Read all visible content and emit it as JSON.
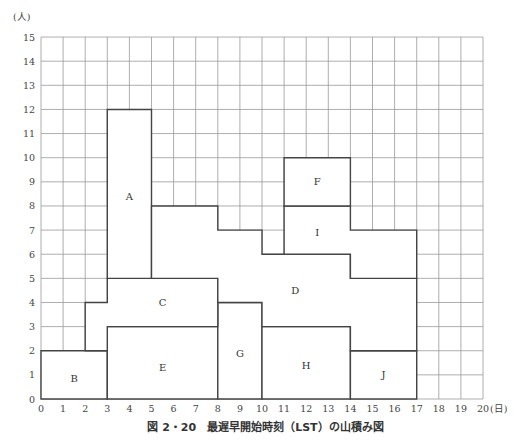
{
  "chart_data": {
    "type": "heatmap",
    "subtype": "resource-loading (yamazumi) block chart",
    "xlabel": "(日)",
    "ylabel": "(人)",
    "xlim": [
      0,
      20
    ],
    "ylim": [
      0,
      15
    ],
    "xticks": [
      0,
      1,
      2,
      3,
      4,
      5,
      6,
      7,
      8,
      9,
      10,
      11,
      12,
      13,
      14,
      15,
      16,
      17,
      18,
      19,
      20
    ],
    "yticks": [
      0,
      1,
      2,
      3,
      4,
      5,
      6,
      7,
      8,
      9,
      10,
      11,
      12,
      13,
      14,
      15
    ],
    "grid": true,
    "blocks": [
      {
        "label": "B",
        "x_start": 0,
        "x_end": 3,
        "y_bottom": 0,
        "y_top": 2
      },
      {
        "label": "E",
        "x_start": 3,
        "x_end": 8,
        "y_bottom": 0,
        "y_top": 3
      },
      {
        "label": "G",
        "x_start": 8,
        "x_end": 10,
        "y_bottom": 0,
        "y_top": 4
      },
      {
        "label": "H",
        "x_start": 10,
        "x_end": 14,
        "y_bottom": 0,
        "y_top": 3
      },
      {
        "label": "J",
        "x_start": 14,
        "x_end": 17,
        "y_bottom": 0,
        "y_top": 2
      },
      {
        "label": "C",
        "x_start": 2,
        "x_end": 8,
        "y_bottom": "2-3",
        "y_top": "4-5"
      },
      {
        "label": "A",
        "x_start": 3,
        "x_end": 5,
        "y_bottom": 5,
        "y_top": 12
      },
      {
        "label": "D",
        "x_start": 5,
        "x_end": 17,
        "y_bottom": "3-5",
        "y_top": "5-8"
      },
      {
        "label": "I",
        "x_start": 11,
        "x_end": 17,
        "y_bottom": "5-6",
        "y_top": "7-8"
      },
      {
        "label": "F",
        "x_start": 11,
        "x_end": 14,
        "y_bottom": 8,
        "y_top": 10
      }
    ],
    "total_profile": {
      "x": [
        0,
        1,
        2,
        3,
        4,
        5,
        6,
        7,
        8,
        9,
        10,
        11,
        12,
        13,
        14,
        15,
        16,
        17
      ],
      "workers": [
        2,
        2,
        4,
        12,
        12,
        8,
        8,
        8,
        7,
        7,
        6,
        10,
        10,
        10,
        7,
        7,
        7,
        0
      ]
    }
  },
  "axis": {
    "y_unit": "(人)",
    "x_unit": "(日)"
  },
  "caption": "図 2・20　最遅早開始時刻（LST）の山積み図"
}
